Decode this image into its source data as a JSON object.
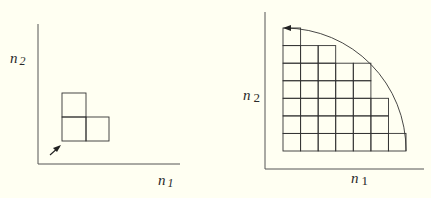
{
  "colors": {
    "background": "#fffff2",
    "stroke": "#333333",
    "axis": "#666666"
  },
  "left_figure": {
    "y_axis_label": "n",
    "y_axis_sub": "2",
    "x_axis_label": "n",
    "x_axis_sub": "1",
    "cells": [
      [
        0,
        0
      ],
      [
        1,
        0
      ],
      [
        0,
        1
      ]
    ],
    "arrow": "diagonal-arrow-toward-origin"
  },
  "right_figure": {
    "y_axis_label": "n",
    "y_axis_sub": "2",
    "x_axis_label": "n",
    "x_axis_sub": "1",
    "row_lengths_bottom_to_top": [
      7,
      6,
      6,
      5,
      5,
      3,
      1
    ],
    "arc": "quarter-circle-with-arrowhead-at-top-left"
  }
}
